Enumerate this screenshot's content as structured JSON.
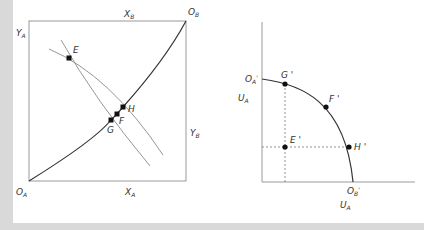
{
  "left_panel": {
    "title": "Edgeworth box",
    "labels": {
      "origin_a": {
        "main": "O",
        "sub": "A"
      },
      "origin_b": {
        "main": "O",
        "sub": "B"
      },
      "x_b": {
        "main": "X",
        "sub": "B"
      },
      "x_a": {
        "main": "X",
        "sub": "A"
      },
      "y_a": {
        "main": "Y",
        "sub": "A"
      },
      "y_b": {
        "main": "Y",
        "sub": "B"
      }
    },
    "points": {
      "E": "E",
      "F": "F",
      "G": "G",
      "H": "H"
    }
  },
  "right_panel": {
    "title": "Utility possibility frontier",
    "labels": {
      "origin_a_prime": {
        "main": "O",
        "sub": "A",
        "prime": "'"
      },
      "origin_b_prime": {
        "main": "O",
        "sub": "B",
        "prime": "'"
      },
      "y_axis": {
        "main": "U",
        "sub": "A"
      },
      "x_axis": {
        "main": "U",
        "sub": "A"
      }
    },
    "points": {
      "G_prime": "G '",
      "F_prime": "F '",
      "E_prime": "E '",
      "H_prime": "H '"
    }
  },
  "colors": {
    "frame": "#d9d9d9",
    "axis": "#9a9a9a",
    "contract_curve": "#333333",
    "indifference": "#8a8a8a",
    "point": "#111111",
    "dashed": "#777777"
  }
}
